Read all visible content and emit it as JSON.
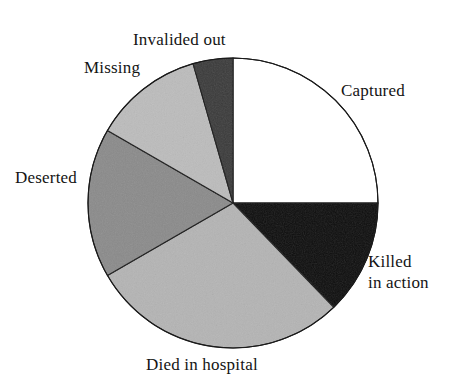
{
  "figure": {
    "background_color": "#ffffff",
    "text_color": "#141414"
  },
  "chart_data": {
    "type": "pie",
    "title": "",
    "subtitle": "",
    "xlabel": "",
    "ylabel": "",
    "legend_position": "none",
    "labels_position": "outside-around-pie",
    "grid": false,
    "start_angle_deg": 0,
    "direction": "clockwise",
    "center": {
      "x": 233,
      "y": 203
    },
    "radius": 145,
    "categories": [
      "Captured",
      "Killed in action",
      "Died in hospital",
      "Deserted",
      "Missing",
      "Invalided out"
    ],
    "values": [
      25.0,
      12.8,
      28.9,
      16.7,
      12.2,
      4.4
    ],
    "units": "percent",
    "slices": [
      {
        "label": "Captured",
        "label_lines": [
          "Captured"
        ],
        "value": 25.0,
        "start_angle_deg": 0,
        "end_angle_deg": 90,
        "fill": "#ffffff",
        "stroke": "#1a1a1a"
      },
      {
        "label": "Killed in action",
        "label_lines": [
          "Killed",
          "in action"
        ],
        "value": 12.8,
        "start_angle_deg": 90,
        "end_angle_deg": 136,
        "fill": "#0d0d0d",
        "stroke": "#1a1a1a"
      },
      {
        "label": "Died in hospital",
        "label_lines": [
          "Died in hospital"
        ],
        "value": 28.9,
        "start_angle_deg": 136,
        "end_angle_deg": 240,
        "fill": "#b4b4b4",
        "stroke": "#1a1a1a"
      },
      {
        "label": "Deserted",
        "label_lines": [
          "Deserted"
        ],
        "value": 16.7,
        "start_angle_deg": 240,
        "end_angle_deg": 300,
        "fill": "#8a8a8a",
        "stroke": "#1a1a1a"
      },
      {
        "label": "Missing",
        "label_lines": [
          "Missing"
        ],
        "value": 12.2,
        "start_angle_deg": 300,
        "end_angle_deg": 344,
        "fill": "#bcbcbc",
        "stroke": "#1a1a1a"
      },
      {
        "label": "Invalided out",
        "label_lines": [
          "Invalided out"
        ],
        "value": 4.4,
        "start_angle_deg": 344,
        "end_angle_deg": 360,
        "fill": "#3a3a3a",
        "stroke": "#1a1a1a"
      }
    ]
  },
  "labels": {
    "captured": "Captured",
    "killed_line1": "Killed",
    "killed_line2": "in action",
    "died_in_hospital": "Died in hospital",
    "deserted": "Deserted",
    "missing": "Missing",
    "invalided_out": "Invalided out"
  }
}
